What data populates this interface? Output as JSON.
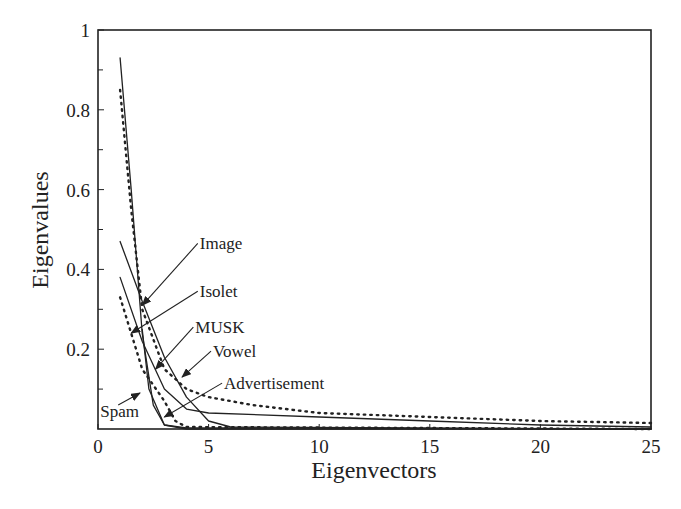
{
  "chart_data": {
    "type": "line",
    "title": "",
    "xlabel": "Eigenvectors",
    "ylabel": "Eigenvalues",
    "xlim": [
      0,
      25
    ],
    "ylim": [
      0,
      1
    ],
    "x_ticks": [
      0,
      5,
      10,
      15,
      20,
      25
    ],
    "x_tick_labels": [
      "0",
      "5",
      "10",
      "15",
      "20",
      "25"
    ],
    "y_ticks": [
      0.2,
      0.4,
      0.6,
      0.8,
      1
    ],
    "y_tick_labels": [
      "0.2",
      "0.4",
      "0.6",
      "0.8",
      "1"
    ],
    "y_minor_ticks": [
      0.1,
      0.3,
      0.5,
      0.7,
      0.9
    ],
    "grid": false,
    "legend": "inline annotations with arrows",
    "series": [
      {
        "name": "Image",
        "style": "solid",
        "x": [
          1,
          1.5,
          2,
          2.5,
          3,
          4,
          25
        ],
        "values": [
          0.93,
          0.6,
          0.24,
          0.06,
          0.01,
          0.003,
          0.0
        ]
      },
      {
        "name": "Isolet",
        "style": "dotted",
        "x": [
          1,
          1.5,
          2,
          3,
          4,
          5,
          7,
          10,
          15,
          20,
          25
        ],
        "values": [
          0.85,
          0.55,
          0.3,
          0.15,
          0.1,
          0.08,
          0.06,
          0.04,
          0.03,
          0.02,
          0.015
        ]
      },
      {
        "name": "MUSK",
        "style": "solid",
        "x": [
          1,
          2,
          3,
          4,
          5,
          10,
          15,
          20,
          25
        ],
        "values": [
          0.38,
          0.22,
          0.1,
          0.05,
          0.04,
          0.03,
          0.02,
          0.01,
          0.005
        ]
      },
      {
        "name": "Vowel",
        "style": "solid",
        "x": [
          1,
          2,
          3,
          4,
          5,
          6,
          25
        ],
        "values": [
          0.47,
          0.32,
          0.18,
          0.08,
          0.02,
          0.005,
          0.0
        ]
      },
      {
        "name": "Advertisement",
        "style": "dotted",
        "x": [
          1,
          2,
          3,
          3.5,
          4,
          25
        ],
        "values": [
          0.33,
          0.15,
          0.07,
          0.02,
          0.005,
          0.0
        ]
      },
      {
        "name": "Spam",
        "style": "solid",
        "x": [
          2,
          2.3,
          3,
          4,
          25
        ],
        "values": [
          0.25,
          0.1,
          0.01,
          0.0,
          0.0
        ]
      }
    ],
    "annotations": [
      {
        "label": "Image",
        "text_x": 4.6,
        "text_y": 0.45,
        "arrow_to_x": 2.0,
        "arrow_to_y": 0.31
      },
      {
        "label": "Isolet",
        "text_x": 4.6,
        "text_y": 0.33,
        "arrow_to_x": 1.5,
        "arrow_to_y": 0.24
      },
      {
        "label": "MUSK",
        "text_x": 4.4,
        "text_y": 0.24,
        "arrow_to_x": 2.6,
        "arrow_to_y": 0.15
      },
      {
        "label": "Vowel",
        "text_x": 5.2,
        "text_y": 0.18,
        "arrow_to_x": 3.8,
        "arrow_to_y": 0.13
      },
      {
        "label": "Advertisement",
        "text_x": 5.7,
        "text_y": 0.1,
        "arrow_to_x": 3.0,
        "arrow_to_y": 0.03
      },
      {
        "label": "Spam",
        "text_x": 0.1,
        "text_y": 0.03,
        "arrow_to_x": 1.9,
        "arrow_to_y": 0.09
      }
    ]
  }
}
